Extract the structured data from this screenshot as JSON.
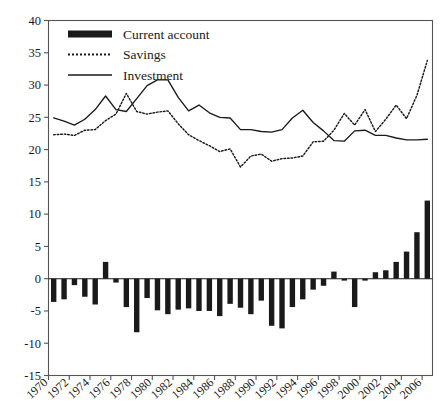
{
  "chart_data": {
    "type": "bar",
    "title": "",
    "subtitle": "",
    "xlabel": "",
    "ylabel": "",
    "xlim": [
      1970,
      2006
    ],
    "ylim": [
      -15,
      40
    ],
    "yticks": [
      -15,
      -10,
      -5,
      0,
      5,
      10,
      15,
      20,
      25,
      30,
      35,
      40
    ],
    "ytick_labels": [
      "-15",
      "-10",
      "-5",
      "0",
      "5",
      "10",
      "15",
      "20",
      "25",
      "30",
      "35",
      "40"
    ],
    "grid": false,
    "legend_position": "top-left",
    "x": [
      1970,
      1971,
      1972,
      1973,
      1974,
      1975,
      1976,
      1977,
      1978,
      1979,
      1980,
      1981,
      1982,
      1983,
      1984,
      1985,
      1986,
      1987,
      1988,
      1989,
      1990,
      1991,
      1992,
      1993,
      1994,
      1995,
      1996,
      1997,
      1998,
      1999,
      2000,
      2001,
      2002,
      2003,
      2004,
      2005,
      2006
    ],
    "xtick_values": [
      1970,
      1972,
      1974,
      1976,
      1978,
      1980,
      1982,
      1984,
      1986,
      1988,
      1990,
      1992,
      1994,
      1996,
      1998,
      2000,
      2002,
      2004,
      2006
    ],
    "xtick_labels": [
      "1970",
      "1972",
      "1974",
      "1976",
      "1978",
      "1980",
      "1982",
      "1984",
      "1986",
      "1988",
      "1990",
      "1992",
      "1994",
      "1996",
      "1998",
      "2000",
      "2002",
      "2004",
      "2006"
    ],
    "series": [
      {
        "name": "Current account",
        "style": "bar",
        "color": "#1a1a1a",
        "values": [
          -3.6,
          -3.2,
          -1.0,
          -2.8,
          -4.0,
          2.6,
          -0.6,
          -4.4,
          -8.3,
          -3.0,
          -4.9,
          -5.5,
          -4.8,
          -4.6,
          -5.0,
          -5.0,
          -5.8,
          -3.9,
          -4.5,
          -5.5,
          -3.4,
          -7.3,
          -7.7,
          -4.4,
          -3.2,
          -1.7,
          -1.1,
          1.1,
          -0.3,
          -4.4,
          -0.3,
          1.0,
          1.3,
          2.6,
          4.2,
          7.2,
          12.1
        ]
      },
      {
        "name": "Savings",
        "style": "dotted-line",
        "color": "#1a1a1a",
        "values": [
          22.3,
          22.4,
          22.2,
          23.0,
          23.1,
          24.5,
          25.5,
          28.7,
          25.9,
          25.5,
          25.8,
          26.0,
          24.0,
          22.3,
          21.4,
          20.6,
          19.7,
          20.1,
          17.3,
          19.0,
          19.3,
          18.2,
          18.6,
          18.7,
          19.0,
          21.2,
          21.3,
          23.0,
          25.6,
          23.8,
          26.2,
          22.8,
          24.7,
          26.9,
          24.8,
          28.4,
          33.8
        ]
      },
      {
        "name": "Investment",
        "style": "solid-line",
        "color": "#1a1a1a",
        "values": [
          24.9,
          24.4,
          23.8,
          24.7,
          26.2,
          28.3,
          26.2,
          25.9,
          27.9,
          29.9,
          30.8,
          30.8,
          28.1,
          26.0,
          26.9,
          25.7,
          25.0,
          24.9,
          23.1,
          23.1,
          22.8,
          22.7,
          23.1,
          24.9,
          26.1,
          24.2,
          22.9,
          21.4,
          21.3,
          22.9,
          23.0,
          22.2,
          22.2,
          21.8,
          21.5,
          21.5,
          21.6
        ]
      }
    ]
  },
  "legend": {
    "items": [
      {
        "label": "Current account",
        "marker": "thick-bar"
      },
      {
        "label": "Savings",
        "marker": "dotted-line"
      },
      {
        "label": "Investment",
        "marker": "solid-line"
      }
    ]
  },
  "axes": {
    "frame_color": "#555555",
    "tick_color": "#555555",
    "ink": "#1a1a1a"
  }
}
